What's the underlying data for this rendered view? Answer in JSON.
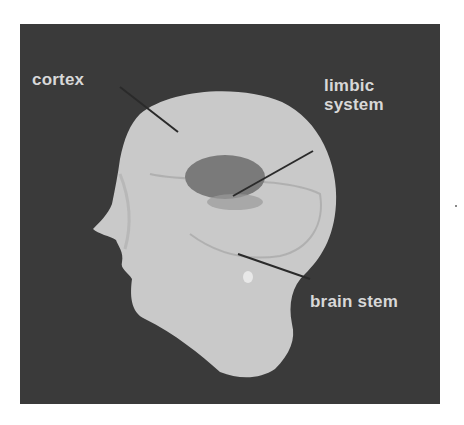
{
  "diagram": {
    "labels": [
      {
        "id": "cortex",
        "text": "cortex"
      },
      {
        "id": "limbic",
        "line1": "limbic",
        "line2": "system"
      },
      {
        "id": "brainstem",
        "text": "brain stem"
      }
    ],
    "colors": {
      "background": "#3a3a3a",
      "head": "#c9c9c9",
      "limbic_region": "#7a7a7a",
      "label_text": "#d8d8d8",
      "leader_line": "#2a2a2a"
    }
  }
}
